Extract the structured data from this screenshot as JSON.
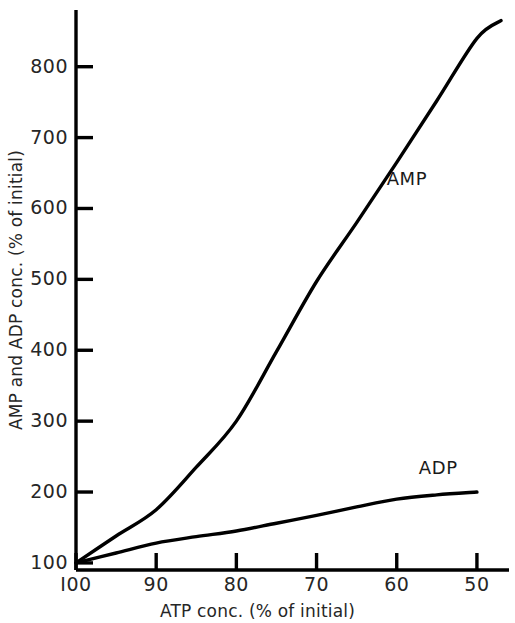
{
  "chart_data": {
    "type": "line",
    "title": "",
    "xlabel": "ATP conc. (% of initial)",
    "ylabel": "AMP and ADP conc. (% of initial)",
    "xlim": [
      100,
      46
    ],
    "ylim": [
      90,
      880
    ],
    "x_ticks": [
      100,
      90,
      80,
      70,
      60,
      50
    ],
    "x_tick_labels": [
      "I00",
      "90",
      "80",
      "70",
      "60",
      "50"
    ],
    "y_ticks": [
      100,
      200,
      300,
      400,
      500,
      600,
      700,
      800
    ],
    "y_tick_labels": [
      "100",
      "200",
      "300",
      "400",
      "500",
      "600",
      "700",
      "800"
    ],
    "grid": false,
    "legend_position": "inline-annotation",
    "series": [
      {
        "name": "AMP",
        "label_text": "AMP",
        "color": "#000000",
        "x": [
          100,
          95,
          90,
          85,
          80,
          75,
          70,
          65,
          60,
          55,
          50,
          47
        ],
        "values": [
          100,
          138,
          175,
          235,
          300,
          398,
          497,
          580,
          665,
          752,
          840,
          865
        ]
      },
      {
        "name": "ADP",
        "label_text": "ADP",
        "color": "#000000",
        "x": [
          100,
          95,
          90,
          85,
          80,
          75,
          70,
          65,
          60,
          55,
          50
        ],
        "values": [
          100,
          114,
          128,
          137,
          145,
          156,
          167,
          179,
          190,
          196,
          200
        ]
      }
    ],
    "annotations": [
      {
        "text": "AMP",
        "x": 62,
        "y": 640
      },
      {
        "text": "ADP",
        "x": 58,
        "y": 232
      }
    ]
  }
}
